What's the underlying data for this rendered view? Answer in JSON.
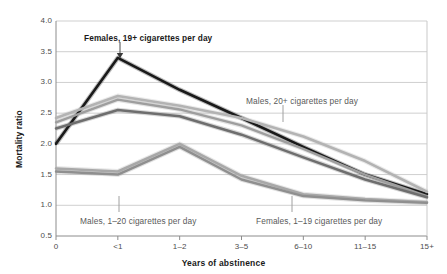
{
  "chart_data": {
    "type": "line",
    "title": "",
    "xlabel": "Years of abstinence",
    "ylabel": "Mortality ratio",
    "categories": [
      "0",
      "<1",
      "1–2",
      "3–5",
      "6–10",
      "11–15",
      "15+"
    ],
    "ylim": [
      0.5,
      4.0
    ],
    "yticks": [
      "0.5",
      "1.0",
      "1.5",
      "2.0",
      "2.5",
      "3.0",
      "3.5",
      "4.0"
    ],
    "ytick_values": [
      0.5,
      1.0,
      1.5,
      2.0,
      2.5,
      3.0,
      3.5,
      4.0
    ],
    "grid": "horizontal",
    "legend_position": "annotations-inline",
    "series": [
      {
        "name": "Females, 19+ cigarettes per day",
        "color": "#1a1a1a",
        "width": 2.6,
        "values": [
          2.0,
          3.4,
          2.88,
          2.42,
          1.95,
          1.5,
          1.18
        ]
      },
      {
        "name": "Males, 20+ cigarettes per day",
        "color": "#b3b3b3",
        "width": 2.6,
        "values": [
          2.42,
          2.78,
          2.62,
          2.42,
          2.12,
          1.72,
          1.22
        ]
      },
      {
        "name": "Males, 20+ cigarettes per day (b)",
        "color": "#9e9e9e",
        "width": 2.4,
        "values": [
          2.35,
          2.72,
          2.56,
          2.3,
          1.92,
          1.5,
          1.15
        ]
      },
      {
        "name": "Males, 1–20 cigarettes per day",
        "color": "#6e6e6e",
        "width": 2.6,
        "values": [
          2.25,
          2.55,
          2.45,
          2.15,
          1.78,
          1.42,
          1.13
        ]
      },
      {
        "name": "Females, 1–19 cigarettes per day",
        "color": "#a8a8a8",
        "width": 2.6,
        "values": [
          1.6,
          1.55,
          2.0,
          1.48,
          1.18,
          1.1,
          1.05
        ]
      },
      {
        "name": "Females, 1–19 cigarettes per day (b)",
        "color": "#8f8f8f",
        "width": 2.4,
        "values": [
          1.55,
          1.5,
          1.95,
          1.42,
          1.15,
          1.08,
          1.04
        ]
      }
    ],
    "annotations": [
      {
        "id": "females-19plus",
        "text": "Females, 19+ cigarettes per day",
        "style": "dark",
        "label_x": 84,
        "label_y": 33,
        "leader_x": 120,
        "leader_y1": 42,
        "leader_y2": 57,
        "arrow": true
      },
      {
        "id": "males-20plus",
        "text": "Males, 20+ cigarettes per day",
        "style": "light",
        "label_x": 246,
        "label_y": 96,
        "leader_x": 283,
        "leader_y1": 105,
        "leader_y2": 122,
        "arrow": false
      },
      {
        "id": "males-1to20",
        "text": "Males, 1–20 cigarettes per day",
        "style": "light",
        "label_x": 80,
        "label_y": 216,
        "leader_x": 119,
        "leader_y1": 196,
        "leader_y2": 212,
        "arrow": false
      },
      {
        "id": "females-1to19",
        "text": "Females, 1–19 cigarettes per day",
        "style": "light",
        "label_x": 256,
        "label_y": 216,
        "leader_x": 292,
        "leader_y1": 196,
        "leader_y2": 212,
        "arrow": false
      }
    ]
  },
  "axis": {
    "y_title": "Mortality ratio",
    "x_title": "Years of abstinence"
  }
}
